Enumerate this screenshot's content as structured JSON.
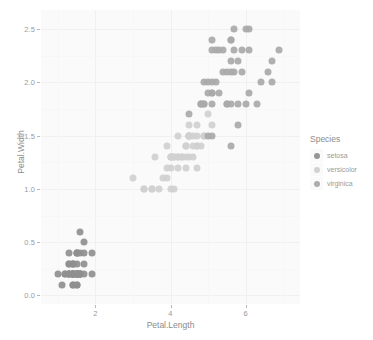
{
  "chart_data": {
    "type": "scatter",
    "title": "",
    "xlabel": "Petal.Length",
    "ylabel": "Petal.Width",
    "xlim": [
      0.55,
      7.45
    ],
    "ylim": [
      -0.08,
      2.68
    ],
    "xticks": [
      2,
      4,
      6
    ],
    "xtick_labels": [
      "2",
      "4",
      "6"
    ],
    "yticks": [
      0.0,
      0.5,
      1.0,
      1.5,
      2.0,
      2.5
    ],
    "ytick_labels": [
      "0.0",
      "0.5",
      "1.0",
      "1.5",
      "2.0",
      "2.5"
    ],
    "grid": true,
    "legend_position": "right",
    "legend_title": "Species",
    "colors": {
      "setosa": "#8f8f8f",
      "versicolor": "#d0d0d0",
      "virginica": "#a9a9a9",
      "panel_background": "#fafafa",
      "grid_major": "#f0f0f0",
      "grid_minor": "#f7f7f7",
      "axis_text": "#9a9a9a",
      "axis_title": "#8c8c8c"
    },
    "series": [
      {
        "name": "setosa",
        "color": "#8f8f8f",
        "points": [
          [
            1.4,
            0.2
          ],
          [
            1.4,
            0.2
          ],
          [
            1.3,
            0.2
          ],
          [
            1.5,
            0.2
          ],
          [
            1.4,
            0.2
          ],
          [
            1.7,
            0.4
          ],
          [
            1.4,
            0.3
          ],
          [
            1.5,
            0.2
          ],
          [
            1.4,
            0.2
          ],
          [
            1.5,
            0.1
          ],
          [
            1.5,
            0.2
          ],
          [
            1.6,
            0.2
          ],
          [
            1.4,
            0.1
          ],
          [
            1.1,
            0.1
          ],
          [
            1.2,
            0.2
          ],
          [
            1.5,
            0.4
          ],
          [
            1.3,
            0.4
          ],
          [
            1.4,
            0.3
          ],
          [
            1.7,
            0.3
          ],
          [
            1.5,
            0.3
          ],
          [
            1.7,
            0.2
          ],
          [
            1.5,
            0.4
          ],
          [
            1.0,
            0.2
          ],
          [
            1.7,
            0.5
          ],
          [
            1.9,
            0.2
          ],
          [
            1.6,
            0.2
          ],
          [
            1.6,
            0.4
          ],
          [
            1.5,
            0.2
          ],
          [
            1.4,
            0.2
          ],
          [
            1.6,
            0.2
          ],
          [
            1.6,
            0.2
          ],
          [
            1.5,
            0.4
          ],
          [
            1.5,
            0.1
          ],
          [
            1.4,
            0.2
          ],
          [
            1.5,
            0.2
          ],
          [
            1.2,
            0.2
          ],
          [
            1.3,
            0.2
          ],
          [
            1.4,
            0.1
          ],
          [
            1.3,
            0.2
          ],
          [
            1.5,
            0.2
          ],
          [
            1.3,
            0.3
          ],
          [
            1.3,
            0.3
          ],
          [
            1.3,
            0.2
          ],
          [
            1.6,
            0.6
          ],
          [
            1.9,
            0.4
          ],
          [
            1.4,
            0.3
          ],
          [
            1.6,
            0.2
          ],
          [
            1.4,
            0.2
          ],
          [
            1.5,
            0.2
          ],
          [
            1.4,
            0.2
          ]
        ]
      },
      {
        "name": "versicolor",
        "color": "#d0d0d0",
        "points": [
          [
            4.7,
            1.4
          ],
          [
            4.5,
            1.5
          ],
          [
            4.9,
            1.5
          ],
          [
            4.0,
            1.3
          ],
          [
            4.6,
            1.5
          ],
          [
            4.5,
            1.3
          ],
          [
            4.7,
            1.6
          ],
          [
            3.3,
            1.0
          ],
          [
            4.6,
            1.3
          ],
          [
            3.9,
            1.4
          ],
          [
            3.5,
            1.0
          ],
          [
            4.2,
            1.5
          ],
          [
            4.0,
            1.0
          ],
          [
            4.7,
            1.4
          ],
          [
            3.6,
            1.3
          ],
          [
            4.4,
            1.4
          ],
          [
            4.5,
            1.5
          ],
          [
            4.1,
            1.0
          ],
          [
            4.5,
            1.5
          ],
          [
            3.9,
            1.1
          ],
          [
            4.8,
            1.8
          ],
          [
            4.0,
            1.3
          ],
          [
            4.9,
            1.5
          ],
          [
            4.7,
            1.2
          ],
          [
            4.3,
            1.3
          ],
          [
            4.4,
            1.4
          ],
          [
            4.8,
            1.4
          ],
          [
            5.0,
            1.7
          ],
          [
            4.5,
            1.5
          ],
          [
            3.5,
            1.0
          ],
          [
            3.8,
            1.1
          ],
          [
            3.7,
            1.0
          ],
          [
            3.9,
            1.2
          ],
          [
            5.1,
            1.6
          ],
          [
            4.5,
            1.5
          ],
          [
            4.5,
            1.6
          ],
          [
            4.7,
            1.5
          ],
          [
            4.4,
            1.3
          ],
          [
            4.1,
            1.3
          ],
          [
            4.0,
            1.3
          ],
          [
            4.4,
            1.2
          ],
          [
            4.6,
            1.4
          ],
          [
            4.0,
            1.2
          ],
          [
            3.3,
            1.0
          ],
          [
            4.2,
            1.3
          ],
          [
            4.2,
            1.2
          ],
          [
            4.2,
            1.3
          ],
          [
            4.3,
            1.3
          ],
          [
            3.0,
            1.1
          ],
          [
            4.1,
            1.3
          ]
        ]
      },
      {
        "name": "virginica",
        "color": "#a9a9a9",
        "points": [
          [
            6.0,
            2.5
          ],
          [
            5.1,
            1.9
          ],
          [
            5.9,
            2.1
          ],
          [
            5.6,
            1.8
          ],
          [
            5.8,
            2.2
          ],
          [
            6.6,
            2.1
          ],
          [
            4.5,
            1.7
          ],
          [
            6.3,
            1.8
          ],
          [
            5.8,
            1.8
          ],
          [
            6.1,
            2.5
          ],
          [
            5.1,
            2.0
          ],
          [
            5.3,
            1.9
          ],
          [
            5.5,
            2.1
          ],
          [
            5.0,
            2.0
          ],
          [
            5.1,
            2.4
          ],
          [
            5.3,
            2.3
          ],
          [
            5.5,
            1.8
          ],
          [
            6.7,
            2.2
          ],
          [
            6.9,
            2.3
          ],
          [
            5.0,
            1.5
          ],
          [
            5.7,
            2.3
          ],
          [
            4.9,
            2.0
          ],
          [
            6.7,
            2.0
          ],
          [
            4.9,
            1.8
          ],
          [
            5.7,
            2.1
          ],
          [
            6.0,
            1.8
          ],
          [
            4.8,
            1.8
          ],
          [
            4.9,
            1.8
          ],
          [
            5.6,
            2.1
          ],
          [
            5.8,
            1.6
          ],
          [
            6.1,
            1.9
          ],
          [
            6.4,
            2.0
          ],
          [
            5.6,
            2.2
          ],
          [
            5.1,
            1.5
          ],
          [
            5.6,
            1.4
          ],
          [
            6.1,
            2.3
          ],
          [
            5.6,
            2.4
          ],
          [
            5.5,
            1.8
          ],
          [
            4.8,
            1.8
          ],
          [
            5.4,
            2.1
          ],
          [
            5.6,
            2.4
          ],
          [
            5.1,
            2.3
          ],
          [
            5.1,
            1.9
          ],
          [
            5.9,
            2.3
          ],
          [
            5.7,
            2.5
          ],
          [
            5.2,
            2.3
          ],
          [
            5.0,
            1.9
          ],
          [
            5.2,
            2.0
          ],
          [
            5.4,
            2.3
          ],
          [
            5.1,
            1.8
          ]
        ]
      }
    ]
  },
  "legend": {
    "title": "Species",
    "items": [
      {
        "label": "setosa"
      },
      {
        "label": "versicolor"
      },
      {
        "label": "virginica"
      }
    ]
  },
  "axes": {
    "x_title": "Petal.Length",
    "y_title": "Petal.Width"
  }
}
